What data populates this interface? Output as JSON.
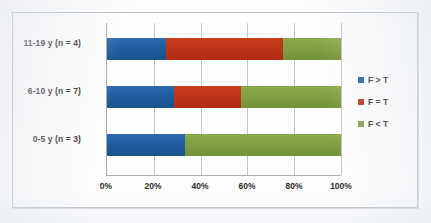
{
  "chart_data": {
    "type": "bar",
    "orientation": "horizontal",
    "stacked": true,
    "stack_mode": "percent",
    "title": "",
    "subtitle": "",
    "xlabel": "",
    "ylabel": "",
    "xlim": [
      0,
      100
    ],
    "xticks": [
      0,
      20,
      40,
      60,
      80,
      100
    ],
    "xtick_labels": [
      "0%",
      "20%",
      "40%",
      "60%",
      "80%",
      "100%"
    ],
    "grid": true,
    "grid_axis": "x",
    "legend_position": "right",
    "categories": [
      "0-5 y  (n = 3)",
      "6-10 y  (n = 7)",
      "11-19 y  (n = 4)"
    ],
    "category_order_top_to_bottom": [
      "11-19 y  (n = 4)",
      "6-10 y  (n = 7)",
      "0-5 y  (n = 3)"
    ],
    "series": [
      {
        "name": "F > T",
        "color": "#1f5c9e",
        "values": [
          33.3,
          28.6,
          25.0
        ]
      },
      {
        "name": "F = T",
        "color": "#be3418",
        "values": [
          0.0,
          28.6,
          50.0
        ]
      },
      {
        "name": "F < T",
        "color": "#80a042",
        "values": [
          66.7,
          42.9,
          25.0
        ]
      }
    ],
    "rows_top_to_bottom": [
      {
        "category": "11-19 y  (n = 4)",
        "segments": [
          {
            "label": "F > T",
            "value": 25.0,
            "color": "#1f5c9e"
          },
          {
            "label": "F = T",
            "value": 50.0,
            "color": "#be3418"
          },
          {
            "label": "F < T",
            "value": 25.0,
            "color": "#80a042"
          }
        ]
      },
      {
        "category": "6-10 y  (n = 7)",
        "segments": [
          {
            "label": "F > T",
            "value": 28.6,
            "color": "#1f5c9e"
          },
          {
            "label": "F = T",
            "value": 28.6,
            "color": "#be3418"
          },
          {
            "label": "F < T",
            "value": 42.9,
            "color": "#80a042"
          }
        ]
      },
      {
        "category": "0-5 y  (n = 3)",
        "segments": [
          {
            "label": "F > T",
            "value": 33.3,
            "color": "#1f5c9e"
          },
          {
            "label": "F = T",
            "value": 0.0,
            "color": "#be3418"
          },
          {
            "label": "F < T",
            "value": 66.7,
            "color": "#80a042"
          }
        ]
      }
    ]
  },
  "axis": {
    "ticks": [
      {
        "label": "0%",
        "pos": 0
      },
      {
        "label": "20%",
        "pos": 20
      },
      {
        "label": "40%",
        "pos": 40
      },
      {
        "label": "60%",
        "pos": 60
      },
      {
        "label": "80%",
        "pos": 80
      },
      {
        "label": "100%",
        "pos": 100
      }
    ]
  },
  "categories": [
    {
      "label": "11-19 y  (n = 4)"
    },
    {
      "label": "6-10 y  (n = 7)"
    },
    {
      "label": "0-5 y  (n = 3)"
    }
  ],
  "legend": {
    "items": [
      {
        "label": "F > T",
        "color": "#1f5c9e"
      },
      {
        "label": "F = T",
        "color": "#be3418"
      },
      {
        "label": "F < T",
        "color": "#80a042"
      }
    ]
  },
  "colors": {
    "series_blue": "#1f5c9e",
    "series_red": "#be3418",
    "series_green": "#80a042",
    "frame_border": "#b9bec6",
    "gridline": "#bfc4ca",
    "axis_line": "#a9aeb5",
    "text": "#2b2b2b",
    "plot_background": "#fefefe",
    "page_background": "#fdfdfd"
  }
}
